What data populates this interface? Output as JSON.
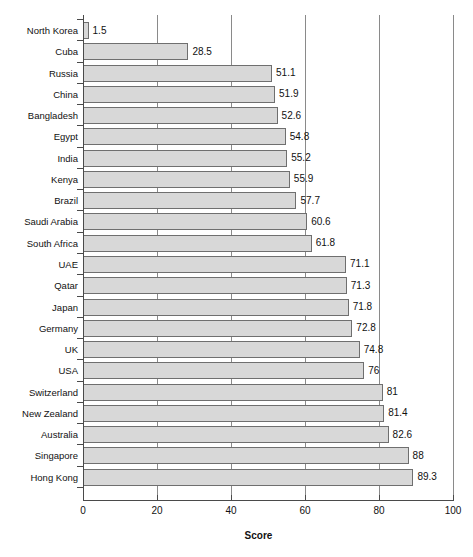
{
  "chart_data": {
    "type": "bar",
    "orientation": "horizontal",
    "title": "",
    "xlabel": "Score",
    "ylabel": "",
    "xlim": [
      0,
      100
    ],
    "xticks": [
      0,
      20,
      40,
      60,
      80,
      100
    ],
    "grid": true,
    "legend": false,
    "bar_color": "#d8d8d8",
    "bar_border_color": "#6f6f6f",
    "axis_color": "#4a4a4a",
    "gridline_color": "#8a8a8a",
    "categories": [
      "North Korea",
      "Cuba",
      "Russia",
      "China",
      "Bangladesh",
      "Egypt",
      "India",
      "Kenya",
      "Brazil",
      "Saudi Arabia",
      "South Africa",
      "UAE",
      "Qatar",
      "Japan",
      "Germany",
      "UK",
      "USA",
      "Switzerland",
      "New Zealand",
      "Australia",
      "Singapore",
      "Hong Kong"
    ],
    "values": [
      1.5,
      28.5,
      51.1,
      51.9,
      52.6,
      54.8,
      55.2,
      55.9,
      57.7,
      60.6,
      61.8,
      71.1,
      71.3,
      71.8,
      72.8,
      74.8,
      76,
      81,
      81.4,
      82.6,
      88,
      89.3
    ],
    "value_labels": [
      "1.5",
      "28.5",
      "51.1",
      "51.9",
      "52.6",
      "54.8",
      "55.2",
      "55.9",
      "57.7",
      "60.6",
      "61.8",
      "71.1",
      "71.3",
      "71.8",
      "72.8",
      "74.8",
      "76",
      "81",
      "81.4",
      "82.6",
      "88",
      "89.3"
    ]
  }
}
